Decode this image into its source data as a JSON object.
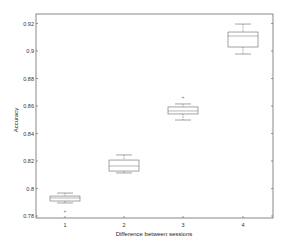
{
  "chart_data": {
    "type": "box",
    "title": "",
    "xlabel": "Difference between sessions",
    "ylabel": "Accuracy",
    "categories": [
      "1",
      "2",
      "3",
      "4"
    ],
    "ylim": [
      0.78,
      0.925
    ],
    "yticks": [
      0.78,
      0.8,
      0.82,
      0.84,
      0.86,
      0.88,
      0.9,
      0.92
    ],
    "ytick_labels": [
      "0.78",
      "0.8",
      "0.82",
      "0.84",
      "0.86",
      "0.88",
      "0.9",
      "0.92"
    ],
    "grid": false,
    "legend": null,
    "boxes": [
      {
        "category": "1",
        "whisker_low": 0.7895,
        "q1": 0.7909,
        "median": 0.7931,
        "q3": 0.7945,
        "whisker_high": 0.7967,
        "outliers": [
          0.7836
        ]
      },
      {
        "category": "2",
        "whisker_low": 0.8113,
        "q1": 0.8127,
        "median": 0.8164,
        "q3": 0.8207,
        "whisker_high": 0.8244,
        "outliers": []
      },
      {
        "category": "3",
        "whisker_low": 0.8498,
        "q1": 0.8542,
        "median": 0.8564,
        "q3": 0.8593,
        "whisker_high": 0.8615,
        "outliers": [
          0.8665
        ]
      },
      {
        "category": "4",
        "whisker_low": 0.8978,
        "q1": 0.9029,
        "median": 0.9109,
        "q3": 0.9138,
        "whisker_high": 0.9196,
        "outliers": []
      }
    ]
  },
  "colors": {
    "axis": "#555555",
    "box": "#666666",
    "median": "#888888",
    "outlier": "#777777"
  }
}
